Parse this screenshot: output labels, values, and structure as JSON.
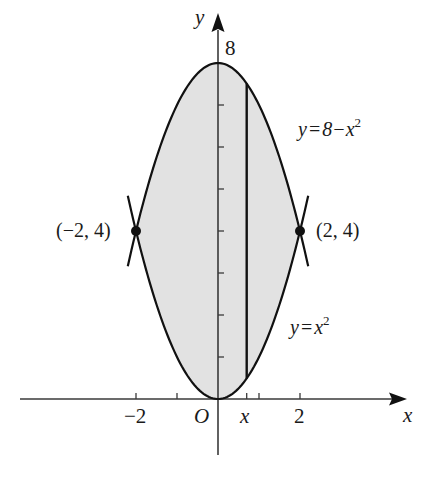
{
  "figure": {
    "axes": {
      "x_label": "x",
      "y_label": "y",
      "origin_label": "O",
      "x_tick_labels": [
        {
          "value": -2,
          "text": "−2"
        },
        {
          "value": 2,
          "text": "2"
        }
      ],
      "x_ticks": [
        -2,
        -1,
        1,
        2
      ],
      "strip_tick_label": "x",
      "y_tick_label": {
        "value": 8,
        "text": "8"
      },
      "y_ticks": [
        1,
        2,
        3,
        4,
        5,
        6,
        7
      ]
    },
    "curves": [
      {
        "name": "upper",
        "equation_lhs": "y",
        "equation_eq": "=",
        "equation_rhs": "8−x",
        "exponent": "2"
      },
      {
        "name": "lower",
        "equation_lhs": "y",
        "equation_eq": "=",
        "equation_rhs": "x",
        "exponent": "2"
      }
    ],
    "intersection_points": [
      {
        "x": -2,
        "y": 4,
        "label": "(−2, 4)"
      },
      {
        "x": 2,
        "y": 4,
        "label": "(2, 4)"
      }
    ],
    "strip": {
      "x": 0.7
    },
    "colors": {
      "shade": "#e2e2e2",
      "curve": "#111111",
      "axis": "#3a3a3a"
    }
  }
}
